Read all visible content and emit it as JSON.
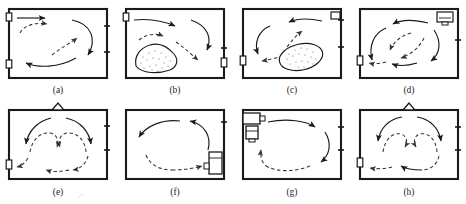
{
  "figure": {
    "kind": "airflow-pattern-diagram",
    "rows": 2,
    "columns": 4,
    "colors": {
      "wall": "#1a1a1a",
      "arrow_solid": "#1a1a1a",
      "arrow_dashed": "#333333",
      "obstacle_outline": "#1a1a1a",
      "stipple": "#4a4a4a",
      "caption": "#262626",
      "background": "#ffffff"
    },
    "legend_semantics": {
      "solid_arrow": "supply jet / primary airflow",
      "dashed_arrow": "induced return / recirculation flow",
      "wall_slot": "inlet or outlet opening in wall",
      "triangle": "ceiling diffuser",
      "box_unit": "supply air terminal unit",
      "stippled_blob": "heat source / occupied obstacle"
    }
  },
  "panels": [
    {
      "id": "a",
      "caption": "(a)",
      "openings": [
        "left-upper",
        "left-lower",
        "right-upper",
        "right-lower"
      ],
      "fixtures": [],
      "obstacle": null,
      "flow": "horizontal supply at upper left, descending along right wall, return along floor to lower left"
    },
    {
      "id": "b",
      "caption": "(b)",
      "openings": [
        "left-upper",
        "right-lower"
      ],
      "fixtures": [],
      "obstacle": "irregular stippled blob, lower left",
      "flow": "supply jet across ceiling, descending at right, recirculation over obstacle"
    },
    {
      "id": "c",
      "caption": "(c)",
      "openings": [
        "left-lower",
        "right-upper",
        "right-middle"
      ],
      "fixtures": [],
      "obstacle": "tilted stippled ellipse, lower right of center",
      "flow": "supply from upper right along ceiling, down left wall, return along floor past obstacle"
    },
    {
      "id": "d",
      "caption": "(d)",
      "openings": [
        "left-lower",
        "right-middle"
      ],
      "fixtures": [
        "corner-unit-top-right"
      ],
      "obstacle": null,
      "flow": "nested counter-clockwise elliptical recirculation loops filling the room"
    },
    {
      "id": "e",
      "caption": "(e)",
      "openings": [
        "left-lower",
        "right-upper",
        "right-middle"
      ],
      "fixtures": [
        "ceiling-diffuser-triangle"
      ],
      "obstacle": null,
      "flow": "downward ceiling diffuser jet splitting into twin counter-rotating vortices"
    },
    {
      "id": "f",
      "caption": "(f)",
      "openings": [
        "right-upper"
      ],
      "fixtures": [
        "floor-unit-bottom-right"
      ],
      "obstacle": null,
      "flow": "single large counter-clockwise vortex rising at right, sweeping ceiling leftward"
    },
    {
      "id": "g",
      "caption": "(g)",
      "openings": [
        "right-upper",
        "right-middle"
      ],
      "fixtures": [
        "wall-unit-upper-left"
      ],
      "obstacle": null,
      "flow": "single clockwise vortex from upper-left wall unit across ceiling and down right side"
    },
    {
      "id": "h",
      "caption": "(h)",
      "openings": [
        "left-lower",
        "right-upper",
        "right-middle"
      ],
      "fixtures": [
        "ceiling-diffuser-triangle"
      ],
      "obstacle": null,
      "flow": "symmetric twin vortices beneath ceiling diffuser, return along floor to left outlet"
    }
  ]
}
